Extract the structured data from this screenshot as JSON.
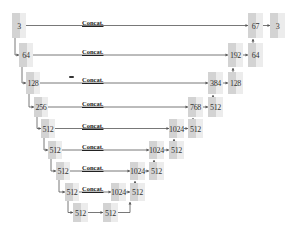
{
  "diagram": {
    "type": "U-Net architecture",
    "skip_label": "Concat.",
    "colors": {
      "block_dark": "#d3d3d3",
      "block_light": "#ececec",
      "line": "#555555"
    },
    "encoder": [
      {
        "label": "3",
        "x": 12,
        "y": 13,
        "w": 14,
        "h": 25
      },
      {
        "label": "64",
        "x": 19,
        "y": 43,
        "w": 14,
        "h": 24
      },
      {
        "label": "128",
        "x": 26,
        "y": 72,
        "w": 14,
        "h": 22
      },
      {
        "label": "256",
        "x": 34,
        "y": 97,
        "w": 14,
        "h": 20
      },
      {
        "label": "512",
        "x": 41,
        "y": 119,
        "w": 14,
        "h": 19
      },
      {
        "label": "512",
        "x": 48,
        "y": 141,
        "w": 14,
        "h": 18
      },
      {
        "label": "512",
        "x": 56,
        "y": 162,
        "w": 14,
        "h": 18
      },
      {
        "label": "512",
        "x": 65,
        "y": 183,
        "w": 14,
        "h": 18
      }
    ],
    "bottleneck": [
      {
        "label": "512",
        "x": 73,
        "y": 203,
        "w": 15,
        "h": 19
      },
      {
        "label": "512",
        "x": 103,
        "y": 203,
        "w": 15,
        "h": 19
      }
    ],
    "decoder": [
      {
        "concat": {
          "label": "67",
          "x": 248,
          "y": 13,
          "w": 15,
          "h": 25
        },
        "out": {
          "label": "3",
          "x": 270,
          "y": 13,
          "w": 15,
          "h": 25
        }
      },
      {
        "concat": {
          "label": "192",
          "x": 228,
          "y": 43,
          "w": 15,
          "h": 24
        },
        "out": {
          "label": "64",
          "x": 248,
          "y": 43,
          "w": 15,
          "h": 24
        }
      },
      {
        "concat": {
          "label": "384",
          "x": 208,
          "y": 72,
          "w": 15,
          "h": 22
        },
        "out": {
          "label": "128",
          "x": 228,
          "y": 72,
          "w": 15,
          "h": 22
        }
      },
      {
        "concat": {
          "label": "768",
          "x": 188,
          "y": 97,
          "w": 15,
          "h": 20
        },
        "out": {
          "label": "512",
          "x": 208,
          "y": 97,
          "w": 15,
          "h": 20
        }
      },
      {
        "concat": {
          "label": "1024",
          "x": 169,
          "y": 119,
          "w": 15,
          "h": 19
        },
        "out": {
          "label": "512",
          "x": 188,
          "y": 119,
          "w": 15,
          "h": 19
        }
      },
      {
        "concat": {
          "label": "1024",
          "x": 149,
          "y": 141,
          "w": 15,
          "h": 18
        },
        "out": {
          "label": "512",
          "x": 169,
          "y": 141,
          "w": 15,
          "h": 18
        }
      },
      {
        "concat": {
          "label": "1024",
          "x": 130,
          "y": 162,
          "w": 15,
          "h": 18
        },
        "out": {
          "label": "512",
          "x": 149,
          "y": 162,
          "w": 15,
          "h": 18
        }
      },
      {
        "concat": {
          "label": "1024",
          "x": 111,
          "y": 183,
          "w": 15,
          "h": 18
        },
        "out": {
          "label": "512",
          "x": 130,
          "y": 183,
          "w": 15,
          "h": 18
        }
      }
    ],
    "concat_label_x": [
      82,
      82,
      82,
      82,
      82,
      82,
      82,
      82
    ]
  }
}
